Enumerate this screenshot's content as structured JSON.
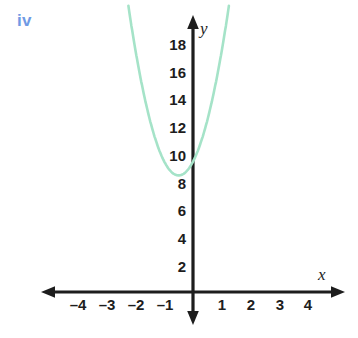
{
  "part_label": "iv",
  "colors": {
    "part_label": "#6f9ae4",
    "curve": "#a5e3c8",
    "axis": "#1d1d1d",
    "background": "#ffffff"
  },
  "chart_data": {
    "type": "line",
    "title": "",
    "subtitle": "",
    "xlabel": "x",
    "ylabel": "y",
    "grid": false,
    "legend": null,
    "xlim": [
      -4.8,
      4.8
    ],
    "ylim": [
      0,
      19.5
    ],
    "x_ticks": [
      -4,
      -3,
      -2,
      -1,
      1,
      2,
      3,
      4
    ],
    "x_tick_labels": [
      "–4",
      "–3",
      "–2",
      "–1",
      "1",
      "2",
      "3",
      "4"
    ],
    "y_ticks": [
      2,
      4,
      6,
      8,
      10,
      12,
      14,
      16,
      18
    ],
    "y_tick_labels": [
      "2",
      "4",
      "6",
      "8",
      "10",
      "12",
      "14",
      "16",
      "18"
    ],
    "series": [
      {
        "name": "parabola",
        "color": "#a5e3c8",
        "equation": "y = 4(x + 0.5)^2 + 8.4",
        "vertex": [
          -0.5,
          8.4
        ],
        "y_intercept": 9.4,
        "x": [
          -2.1,
          -2.0,
          -1.9,
          -1.8,
          -1.7,
          -1.6,
          -1.5,
          -1.4,
          -1.3,
          -1.2,
          -1.1,
          -1.0,
          -0.9,
          -0.8,
          -0.7,
          -0.6,
          -0.5,
          -0.4,
          -0.3,
          -0.2,
          -0.1,
          0.0,
          0.1,
          0.2,
          0.3,
          0.4,
          0.5,
          0.6,
          0.7,
          0.8,
          0.9,
          1.0,
          1.1
        ],
        "values": [
          18.6,
          17.4,
          16.2,
          15.2,
          14.2,
          13.2,
          12.4,
          11.6,
          10.96,
          10.36,
          9.84,
          9.4,
          9.04,
          8.76,
          8.56,
          8.44,
          8.4,
          8.44,
          8.56,
          8.76,
          9.04,
          9.4,
          9.84,
          10.36,
          10.96,
          11.64,
          12.4,
          13.24,
          14.16,
          15.16,
          16.24,
          17.4,
          18.64
        ]
      }
    ]
  }
}
